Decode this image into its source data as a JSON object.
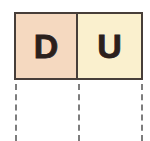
{
  "figure": {
    "name": "place-value-chart",
    "background_color": "#ffffff",
    "border_color": "#473e39"
  },
  "chart_data": {
    "type": "table",
    "title": "",
    "columns": [
      "D",
      "U"
    ],
    "rows": [],
    "cells": [
      {
        "label": "D",
        "fill_color": "#f5d9c0",
        "text_color": "#2b201c"
      },
      {
        "label": "U",
        "fill_color": "#faf0ce",
        "text_color": "#2b201c"
      }
    ],
    "annotations": [
      {
        "name": "dashed-guide-left",
        "style": "dashed",
        "color": "#7d7d7d"
      },
      {
        "name": "dashed-guide-middle",
        "style": "dashed",
        "color": "#7d7d7d"
      },
      {
        "name": "dashed-guide-right",
        "style": "dashed",
        "color": "#7d7d7d"
      }
    ]
  }
}
